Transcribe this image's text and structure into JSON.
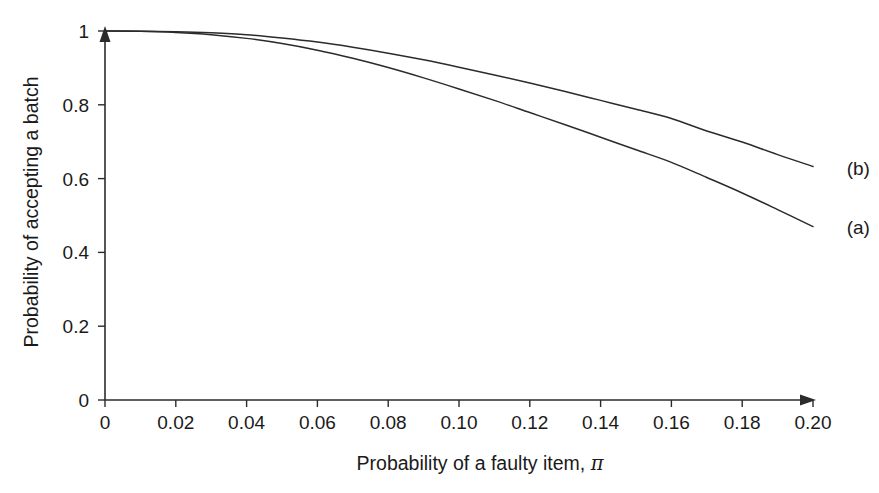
{
  "figure": {
    "background_color": "#ffffff",
    "line_color": "#2b2b2b",
    "text_color": "#1a1a1a"
  },
  "chart_data": {
    "type": "line",
    "title": "",
    "xlabel": "Probability of a faulty item, ",
    "xlabel_symbol": "π",
    "ylabel": "Probability of accepting a batch",
    "xlim": [
      0,
      0.2
    ],
    "ylim": [
      0,
      1
    ],
    "grid": false,
    "legend_position": "right-inline-labels",
    "xticklabels": [
      "0",
      "0.02",
      "0.04",
      "0.06",
      "0.08",
      "0.10",
      "0.12",
      "0.14",
      "0.16",
      "0.18",
      "0.20"
    ],
    "xtickvalues": [
      0,
      0.02,
      0.04,
      0.06,
      0.08,
      0.1,
      0.12,
      0.14,
      0.16,
      0.18,
      0.2
    ],
    "yticklabels": [
      "0",
      "0.2",
      "0.4",
      "0.6",
      "0.8",
      "1"
    ],
    "ytickvalues": [
      0,
      0.2,
      0.4,
      0.6,
      0.8,
      1.0
    ],
    "x": [
      0,
      0.01,
      0.02,
      0.03,
      0.04,
      0.05,
      0.06,
      0.07,
      0.08,
      0.09,
      0.1,
      0.11,
      0.12,
      0.13,
      0.14,
      0.15,
      0.16,
      0.17,
      0.18,
      0.19,
      0.2
    ],
    "series": [
      {
        "name": "(b)",
        "label": "(b)",
        "label_x": 0.205,
        "label_y": 0.63,
        "values": [
          1.0,
          0.9995,
          0.998,
          0.995,
          0.99,
          0.981,
          0.97,
          0.956,
          0.94,
          0.922,
          0.902,
          0.881,
          0.859,
          0.836,
          0.812,
          0.788,
          0.763,
          0.729,
          0.699,
          0.665,
          0.633
        ]
      },
      {
        "name": "(a)",
        "label": "(a)",
        "label_x": 0.205,
        "label_y": 0.47,
        "values": [
          1.0,
          0.999,
          0.996,
          0.99,
          0.98,
          0.966,
          0.948,
          0.926,
          0.901,
          0.873,
          0.843,
          0.812,
          0.779,
          0.746,
          0.712,
          0.678,
          0.644,
          0.603,
          0.561,
          0.516,
          0.47
        ]
      }
    ]
  }
}
